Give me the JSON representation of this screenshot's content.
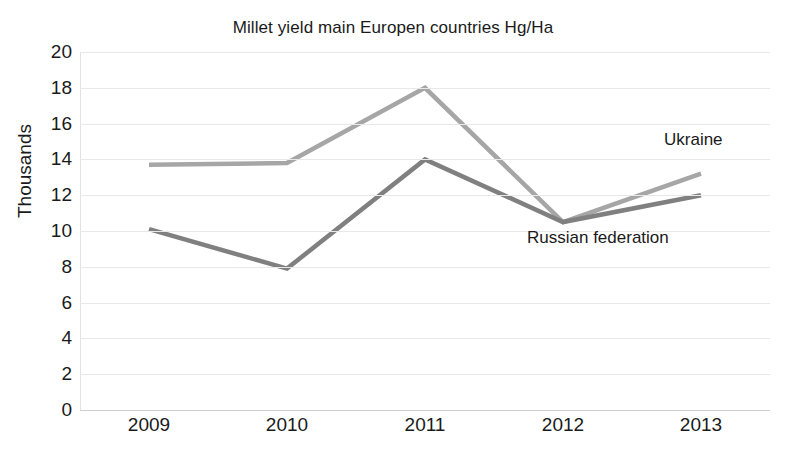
{
  "chart_data": {
    "type": "line",
    "title": "Millet yield main Europen countries Hg/Ha",
    "xlabel": "",
    "ylabel": "Thousands",
    "categories": [
      "2009",
      "2010",
      "2011",
      "2012",
      "2013"
    ],
    "x": [
      2009,
      2010,
      2011,
      2012,
      2013
    ],
    "ylim": [
      0,
      20
    ],
    "ytick_step": 2,
    "yticks": [
      "20",
      "18",
      "16",
      "14",
      "12",
      "10",
      "8",
      "6",
      "4",
      "2",
      "0"
    ],
    "grid": true,
    "legend_position": "inline-labels",
    "series": [
      {
        "name": "Ukraine",
        "color": "#a6a6a6",
        "values": [
          13.7,
          13.8,
          18.0,
          10.5,
          13.2
        ]
      },
      {
        "name": "Russian federation",
        "color": "#808080",
        "values": [
          10.1,
          7.9,
          14.0,
          10.5,
          12.0
        ]
      }
    ],
    "annotations": [
      {
        "text": "Ukraine",
        "series": "Ukraine"
      },
      {
        "text": "Russian federation",
        "series": "Russian federation"
      }
    ]
  },
  "colors": {
    "background": "#ffffff",
    "text": "#1a1a1a",
    "gridline": "#e8e8e8",
    "axis": "#cfcfcf",
    "ukraine": "#a6a6a6",
    "russian_federation": "#808080"
  }
}
